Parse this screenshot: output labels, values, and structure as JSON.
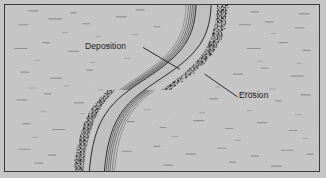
{
  "figure": {
    "background_color": "#c8c8c8",
    "frame_color": "#3a3a3a",
    "ink_color": "#1a1a1a",
    "width": 326,
    "height": 178
  },
  "labels": {
    "deposition": "Deposition",
    "erosion": "Erosion"
  },
  "diagram_data": {
    "type": "diagram",
    "subject": "river-meander-cross-section-map",
    "features": [
      {
        "name": "channel",
        "description": "S-shaped meandering river channel crossing the frame from top to bottom",
        "enters_at": "top",
        "exits_at": "bottom"
      },
      {
        "name": "point-bar",
        "label": "Deposition",
        "description": "Nested scroll lines on the inside of each bend indicating sediment deposition",
        "side_upper_bend": "left",
        "side_lower_bend": "right"
      },
      {
        "name": "cut-bank",
        "label": "Erosion",
        "description": "Dark stippled fringe on the outside of each bend indicating bank erosion",
        "side_upper_bend": "right",
        "side_lower_bend": "left"
      },
      {
        "name": "floodplain",
        "description": "Scattered short horizontal dashes representing flat floodplain texture"
      }
    ],
    "leader_lines": [
      {
        "label": "Deposition",
        "from": [
          143,
          47
        ],
        "to": [
          180,
          69
        ]
      },
      {
        "label": "Erosion",
        "from": [
          238,
          97
        ],
        "to": [
          205,
          74
        ]
      }
    ]
  }
}
